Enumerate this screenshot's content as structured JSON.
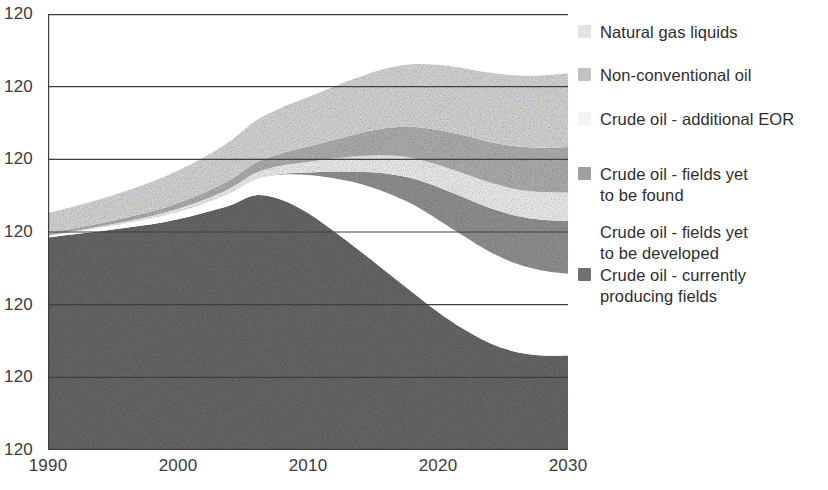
{
  "chart_data": {
    "type": "area",
    "title": "",
    "subtitle": "",
    "xlabel": "",
    "ylabel": "",
    "stacked": true,
    "grid": true,
    "legend_position": "right",
    "x": [
      1990,
      1992,
      1994,
      1996,
      1998,
      2000,
      2002,
      2004,
      2006,
      2008,
      2010,
      2012,
      2014,
      2016,
      2018,
      2020,
      2022,
      2024,
      2026,
      2028,
      2030
    ],
    "xlim": [
      1990,
      2030
    ],
    "xticks": [
      "1990",
      "2000",
      "2010",
      "2020",
      "2030"
    ],
    "yticks": [
      "120",
      "120",
      "120",
      "120",
      "120",
      "120",
      "120"
    ],
    "ylim": [
      0,
      120
    ],
    "series": [
      {
        "name": "Crude oil - currently producing fields",
        "color": "#6e6e6e",
        "values": [
          58.5,
          59.4,
          60.2,
          61.2,
          62.1,
          63.5,
          65.3,
          67.3,
          70.1,
          68.8,
          65.2,
          60.2,
          54.8,
          49.1,
          43.5,
          38.0,
          33.2,
          29.4,
          27.0,
          26.0,
          26.0
        ]
      },
      {
        "name": "Crude oil - fields yet to be developed",
        "color": "#ffffff",
        "values": [
          0.4,
          0.6,
          0.9,
          1.2,
          1.6,
          2.0,
          2.5,
          3.3,
          4.4,
          7.0,
          10.5,
          14.6,
          18.5,
          21.8,
          24.2,
          25.4,
          25.6,
          25.1,
          24.3,
          23.4,
          22.5
        ]
      },
      {
        "name": "Crude oil - fields yet to be found",
        "color": "#9a9a9a",
        "values": [
          0.0,
          0.0,
          0.0,
          0.0,
          0.0,
          0.0,
          0.0,
          0.0,
          0.0,
          0.2,
          0.7,
          1.8,
          3.3,
          5.2,
          7.1,
          9.0,
          10.7,
          12.1,
          13.2,
          14.0,
          14.6
        ]
      },
      {
        "name": "Crude oil - additional EOR",
        "color": "#fbfbfb",
        "values": [
          0.2,
          0.3,
          0.4,
          0.5,
          0.7,
          0.9,
          1.1,
          1.4,
          1.8,
          2.3,
          2.9,
          3.6,
          4.3,
          5.0,
          5.6,
          6.1,
          6.6,
          7.0,
          7.3,
          7.6,
          7.8
        ]
      },
      {
        "name": "Non-conventional oil",
        "color": "#b9b9b9",
        "values": [
          0.6,
          0.7,
          0.9,
          1.1,
          1.3,
          1.6,
          1.9,
          2.3,
          2.8,
          3.4,
          4.2,
          5.2,
          6.3,
          7.5,
          8.6,
          9.6,
          10.5,
          11.2,
          11.8,
          12.2,
          12.5
        ]
      },
      {
        "name": "Natural gas liquids",
        "color": "#e2e2e2",
        "values": [
          5.5,
          6.0,
          6.6,
          7.3,
          8.1,
          8.9,
          9.8,
          10.7,
          11.6,
          12.6,
          13.6,
          14.6,
          15.5,
          16.4,
          17.2,
          17.9,
          18.5,
          19.0,
          19.5,
          19.9,
          20.3
        ]
      }
    ]
  },
  "axes": {
    "y_ticks": [
      {
        "label": "120"
      },
      {
        "label": "120"
      },
      {
        "label": "120"
      },
      {
        "label": "120"
      },
      {
        "label": "120"
      },
      {
        "label": "120"
      },
      {
        "label": "120"
      }
    ],
    "x_ticks": [
      {
        "label": "1990"
      },
      {
        "label": "2000"
      },
      {
        "label": "2010"
      },
      {
        "label": "2020"
      },
      {
        "label": "2030"
      }
    ]
  },
  "legend": {
    "items": [
      {
        "label": "Natural gas liquids",
        "swatch": "#e2e2e2",
        "has_swatch": true
      },
      {
        "label": "Non-conventional oil",
        "swatch": "#c2c2c2",
        "has_swatch": true
      },
      {
        "label": "Crude oil - additional EOR",
        "swatch": "#f4f4f4",
        "has_swatch": true
      },
      {
        "label": "Crude oil - fields yet\nto be found",
        "swatch": "#9f9f9f",
        "has_swatch": true
      },
      {
        "label": "Crude oil - fields yet\nto be developed",
        "swatch": "#ffffff",
        "has_swatch": false
      },
      {
        "label": "Crude oil - currently\nproducing fields",
        "swatch": "#707070",
        "has_swatch": true
      }
    ]
  },
  "style": {
    "axis_color": "#3f3f3f",
    "grid_color": "#3f3f3f",
    "text_color": "#3b3b3b",
    "background": "#ffffff"
  }
}
